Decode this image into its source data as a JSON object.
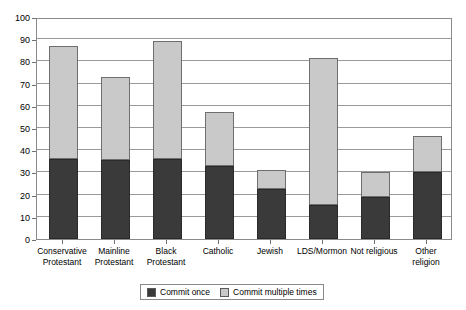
{
  "chart_data": {
    "type": "bar",
    "stacked": true,
    "title": "",
    "subtitle": "",
    "xlabel": "",
    "ylabel": "",
    "ylim": [
      0,
      100
    ],
    "ytick_step": 10,
    "yticks": [
      0,
      10,
      20,
      30,
      40,
      50,
      60,
      70,
      80,
      90,
      100
    ],
    "grid": "horizontal",
    "legend_position": "bottom-center",
    "categories": [
      "Conservative\nProtestant",
      "Mainline\nProtestant",
      "Black\nProtestant",
      "Catholic",
      "Jewish",
      "LDS/Mormon",
      "Not religious",
      "Other\nreligion"
    ],
    "series": [
      {
        "name": "Commit once",
        "color": "#3a3a3a",
        "values": [
          36,
          35.5,
          36,
          33,
          22.5,
          15.5,
          19,
          30
        ]
      },
      {
        "name": "Commit multiple times",
        "color": "#c9c9c9",
        "values": [
          51,
          37.5,
          53,
          24,
          8.5,
          66,
          11,
          16.5
        ]
      }
    ],
    "totals": [
      87,
      73,
      89,
      57,
      31,
      81.5,
      30,
      46.5
    ]
  },
  "axis": {
    "y_tick_labels": [
      "0",
      "10",
      "20",
      "30",
      "40",
      "50",
      "60",
      "70",
      "80",
      "90",
      "100"
    ]
  },
  "legend": {
    "entries": [
      {
        "label": "Commit once",
        "color": "#3a3a3a"
      },
      {
        "label": "Commit multiple times",
        "color": "#c9c9c9"
      }
    ]
  },
  "colors": {
    "dark": "#3a3a3a",
    "light": "#c9c9c9",
    "gridline": "#9a9a9a",
    "axis": "#6f6f6f",
    "background": "#ffffff"
  }
}
